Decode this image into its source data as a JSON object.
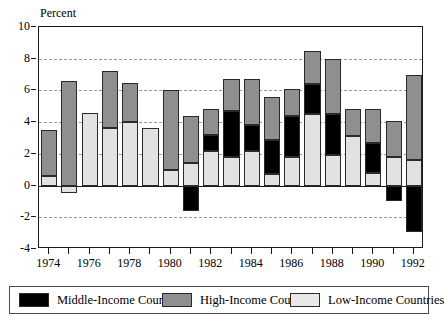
{
  "chart_data": {
    "type": "bar",
    "stacked": true,
    "title": "",
    "xlabel": "",
    "ylabel": "Percent",
    "ylim": [
      -4,
      10
    ],
    "ytick_values": [
      10,
      8,
      6,
      4,
      2,
      0,
      -2,
      -4
    ],
    "ytick_labels": [
      "10",
      "8",
      "6",
      "4",
      "2",
      "0",
      "-2",
      "-4"
    ],
    "gridlines": [
      8,
      6,
      4,
      2,
      -2
    ],
    "grid": true,
    "legend_position": "bottom",
    "x": [
      1974,
      1975,
      1976,
      1977,
      1978,
      1979,
      1980,
      1981,
      1982,
      1983,
      1984,
      1985,
      1986,
      1987,
      1988,
      1989,
      1990,
      1991,
      1992
    ],
    "xtick_labels": [
      "1974",
      "1976",
      "1978",
      "1980",
      "1982",
      "1984",
      "1986",
      "1988",
      "1990",
      "1992"
    ],
    "xtick_values": [
      1974,
      1976,
      1978,
      1980,
      1982,
      1984,
      1986,
      1988,
      1990,
      1992
    ],
    "categories": [
      "1974",
      "1975",
      "1976",
      "1977",
      "1978",
      "1979",
      "1980",
      "1981",
      "1982",
      "1983",
      "1984",
      "1985",
      "1986",
      "1987",
      "1988",
      "1989",
      "1990",
      "1991",
      "1992"
    ],
    "series": [
      {
        "name": "Middle-Income Countries",
        "color": "#000000",
        "values": [
          0.0,
          0.0,
          0.0,
          0.0,
          0.0,
          0.0,
          0.0,
          -1.6,
          1.0,
          2.9,
          1.6,
          2.2,
          2.6,
          1.9,
          2.6,
          0.0,
          1.9,
          -1.0,
          -2.9
        ]
      },
      {
        "name": "High-Income Countries",
        "color": "#8f8f8f",
        "values": [
          2.9,
          6.6,
          0.0,
          3.6,
          2.5,
          0.0,
          5.0,
          3.0,
          1.6,
          2.0,
          2.9,
          2.7,
          1.7,
          2.1,
          3.5,
          1.7,
          2.1,
          2.3,
          5.4
        ]
      },
      {
        "name": "Low-Income Countries",
        "color": "#e2e2e2",
        "values": [
          0.6,
          -0.5,
          4.6,
          3.6,
          4.0,
          3.6,
          1.0,
          1.4,
          2.2,
          1.8,
          2.2,
          0.7,
          1.8,
          4.5,
          1.9,
          3.1,
          0.8,
          1.8,
          1.6
        ]
      }
    ],
    "bar_totals": [
      3.5,
      6.1,
      4.6,
      7.2,
      6.5,
      3.6,
      6.0,
      4.4,
      4.8,
      6.7,
      6.7,
      5.6,
      6.1,
      8.5,
      8.0,
      4.8,
      4.8,
      4.1,
      7.0
    ]
  },
  "legend": {
    "items": [
      {
        "label": "Middle-Income Countries",
        "swatch": "black-swatch"
      },
      {
        "label": "High-Income Countries",
        "swatch": "gray-swatch"
      },
      {
        "label": "Low-Income Countries",
        "swatch": "light-swatch"
      }
    ]
  }
}
